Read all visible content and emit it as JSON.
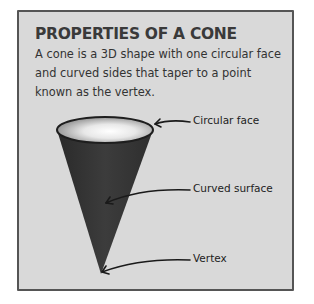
{
  "card": {
    "title": "PROPERTIES OF A CONE",
    "description": "A cone is a 3D shape with one circular face and curved sides that taper to a point known as the vertex."
  },
  "diagram": {
    "shape": "cone",
    "colors": {
      "background": "#d9d9d9",
      "cone_body": "#3a3a3a",
      "cone_top_rim": "#1e1e1e",
      "border": "#555555"
    },
    "labels": [
      {
        "id": "circular-face",
        "text": "Circular face"
      },
      {
        "id": "curved-surface",
        "text": "Curved surface"
      },
      {
        "id": "vertex",
        "text": "Vertex"
      }
    ]
  }
}
